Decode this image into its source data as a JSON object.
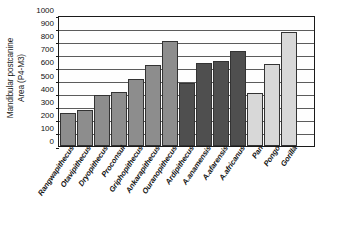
{
  "chart_data": {
    "type": "bar",
    "title": "",
    "xlabel": "",
    "ylabel": "Mandibular postcanine Area (P4-M3)",
    "ylabel_lines": [
      "Mandibular postcanine",
      "Area (P4-M3)"
    ],
    "ylim": [
      0,
      1000
    ],
    "ytick_step": 100,
    "yticks": [
      0,
      100,
      200,
      300,
      400,
      500,
      600,
      700,
      800,
      900,
      1000
    ],
    "grid": true,
    "legend": "none",
    "categories": [
      "Rangwapithecus",
      "Otavipithecus",
      "Dryopithecus",
      "Proconsul",
      "Griphopithecus",
      "Ankarapithecus",
      "Ouranopithecus",
      "Ardipithecus",
      "A.anamensis",
      "A.afarensis",
      "A.africanus",
      "Pan",
      "Pongo",
      "Gorilla"
    ],
    "values": [
      250,
      277,
      390,
      412,
      513,
      628,
      808,
      488,
      637,
      658,
      733,
      405,
      632,
      877
    ],
    "bar_colors": [
      "#8d8d8d",
      "#8d8d8d",
      "#8d8d8d",
      "#8d8d8d",
      "#8d8d8d",
      "#8d8d8d",
      "#8d8d8d",
      "#4f4f4f",
      "#4f4f4f",
      "#4f4f4f",
      "#4f4f4f",
      "#d8d8d8",
      "#d8d8d8",
      "#d8d8d8"
    ],
    "empty_trailing_slot": true
  },
  "colors": {
    "fossil_ape_gray": "#8d8d8d",
    "hominin_dark_gray": "#4f4f4f",
    "extant_ape_light_gray": "#d8d8d8",
    "axis": "#1a1a1a",
    "gridline": "#5b5b5b",
    "background": "#ffffff"
  }
}
